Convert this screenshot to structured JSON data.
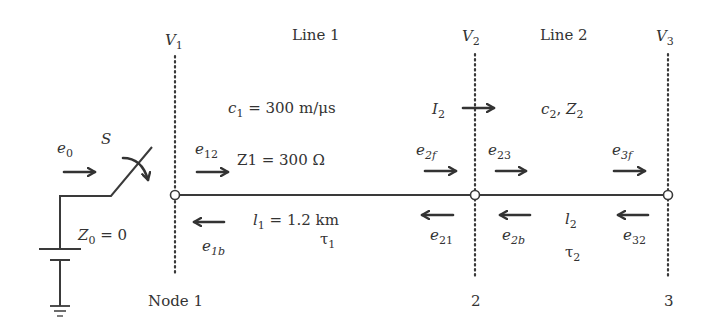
{
  "diagram": {
    "nodes": [
      {
        "voltage": "V",
        "voltage_sub": "1",
        "label": "Node 1"
      },
      {
        "voltage": "V",
        "voltage_sub": "2",
        "label": "2"
      },
      {
        "voltage": "V",
        "voltage_sub": "3",
        "label": "3"
      }
    ],
    "lines": [
      {
        "name": "Line 1",
        "speed_sym": "c",
        "speed_sub": "1",
        "speed_val": " = 300 m/μs",
        "impedance": "Z1 = 300 Ω",
        "length_sym": "l",
        "length_sub": "1",
        "length_val": " = 1.2 km",
        "tau": "τ",
        "tau_sub": "1"
      },
      {
        "name": "Line 2",
        "params_c": "c",
        "params_c_sub": "2",
        "params_sep": ", ",
        "params_z": "Z",
        "params_z_sub": "2",
        "length_sym": "l",
        "length_sub": "2",
        "tau": "τ",
        "tau_sub": "2"
      }
    ],
    "source": {
      "switch": "S",
      "e0": "e",
      "e0_sub": "0",
      "impedance": "Z",
      "impedance_sub": "0",
      "impedance_val": " = 0"
    },
    "current": {
      "sym": "I",
      "sub": "2"
    },
    "waves": {
      "e12": {
        "sym": "e",
        "sub": "12"
      },
      "e1b": {
        "sym": "e",
        "sub": "1b"
      },
      "e2f": {
        "sym": "e",
        "sub": "2f"
      },
      "e21": {
        "sym": "e",
        "sub": "21"
      },
      "e23": {
        "sym": "e",
        "sub": "23"
      },
      "e2b": {
        "sym": "e",
        "sub": "2b"
      },
      "e3f": {
        "sym": "e",
        "sub": "3f"
      },
      "e32": {
        "sym": "e",
        "sub": "32"
      }
    },
    "colors": {
      "ink": "#333333",
      "background": "#ffffff"
    }
  }
}
